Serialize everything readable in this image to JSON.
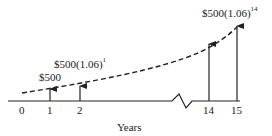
{
  "diagram": {
    "type": "cash-flow-timeline",
    "axis_label": "Years",
    "ticks": [
      {
        "label": "0",
        "x": 22
      },
      {
        "label": "1",
        "x": 50
      },
      {
        "label": "2",
        "x": 80
      },
      {
        "label": "14",
        "x": 209
      },
      {
        "label": "15",
        "x": 237
      }
    ],
    "annotations": {
      "first": {
        "base": "$500",
        "exp": ""
      },
      "second": {
        "base": "$500(1.06)",
        "exp": "1"
      },
      "last": {
        "base": "$500(1.06)",
        "exp": "14"
      }
    },
    "colors": {
      "line": "#222222",
      "background": "#ffffff"
    }
  }
}
